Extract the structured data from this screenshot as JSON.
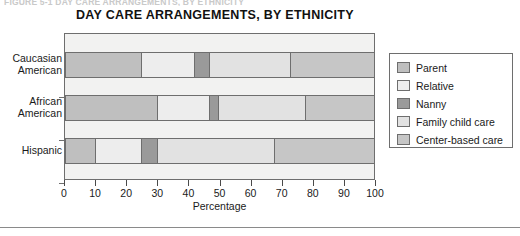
{
  "figure_caption": "FIGURE 5-1  DAY CARE ARRANGEMENTS, BY ETHNICITY",
  "chart_data": {
    "type": "bar",
    "orientation": "horizontal",
    "stacked": true,
    "title": "DAY CARE ARRANGEMENTS, BY ETHNICITY",
    "xlabel": "Percentage",
    "ylabel": "",
    "xlim": [
      0,
      100
    ],
    "xticks": [
      0,
      10,
      20,
      30,
      40,
      50,
      60,
      70,
      80,
      90,
      100
    ],
    "xtick_labels": [
      "0",
      "10",
      "20",
      "30",
      "40",
      "50",
      "60",
      "70",
      "80",
      "90",
      "100"
    ],
    "grid": false,
    "legend_position": "right",
    "categories": [
      "Caucasian American",
      "African American",
      "Hispanic"
    ],
    "series": [
      {
        "name": "Parent",
        "color": "#bfbfbf",
        "values": [
          25,
          30,
          10
        ]
      },
      {
        "name": "Relative",
        "color": "#ededed",
        "values": [
          17,
          17,
          15
        ]
      },
      {
        "name": "Nanny",
        "color": "#9a9a9a",
        "values": [
          5,
          3,
          5
        ]
      },
      {
        "name": "Family child care",
        "color": "#e2e2e2",
        "values": [
          26,
          28,
          38
        ]
      },
      {
        "name": "Center-based care",
        "color": "#c6c6c6",
        "values": [
          27,
          22,
          32
        ]
      }
    ]
  },
  "chart": {
    "title": "DAY CARE ARRANGEMENTS, BY ETHNICITY",
    "x_axis_title": "Percentage",
    "y_labels": [
      "Caucasian\nAmerican",
      "African\nAmerican",
      "Hispanic"
    ],
    "x_tick_labels": [
      "0",
      "10",
      "20",
      "30",
      "40",
      "50",
      "60",
      "70",
      "80",
      "90",
      "100"
    ]
  },
  "legend": {
    "items": [
      {
        "label": "Parent",
        "color": "#bfbfbf"
      },
      {
        "label": "Relative",
        "color": "#ededed"
      },
      {
        "label": "Nanny",
        "color": "#9a9a9a"
      },
      {
        "label": "Family child care",
        "color": "#e2e2e2"
      },
      {
        "label": "Center-based care",
        "color": "#c6c6c6"
      }
    ]
  }
}
